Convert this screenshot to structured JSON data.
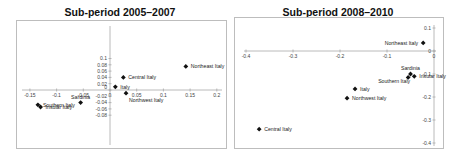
{
  "chart_data": [
    {
      "type": "scatter",
      "title": "Sub-period 2005–2007",
      "xlabel": "",
      "ylabel": "",
      "xlim": [
        -0.15,
        0.2
      ],
      "ylim": [
        -0.08,
        0.1
      ],
      "x_ticks": [
        -0.15,
        -0.1,
        -0.05,
        0,
        0.05,
        0.1,
        0.15,
        0.2
      ],
      "x_tick_labels": [
        "-0.15",
        "-0.1",
        "-0.05",
        "0",
        "0.05",
        "0.1",
        "0.15",
        "0.2"
      ],
      "y_ticks": [
        0.1,
        0.08,
        0.06,
        0.04,
        0.02,
        0,
        -0.02,
        -0.04,
        -0.06,
        -0.08
      ],
      "y_tick_labels": [
        "0.1",
        "0.08",
        "0.06",
        "0.04",
        "0.02",
        "0",
        "-0.02",
        "-0.04",
        "-0.06",
        "-0.08"
      ],
      "grid": false,
      "marker": "diamond",
      "points": [
        {
          "label": "Northeast Italy",
          "x": 0.142,
          "y": 0.075,
          "label_pos": "right"
        },
        {
          "label": "Central Italy",
          "x": 0.025,
          "y": 0.04,
          "label_pos": "right"
        },
        {
          "label": "Italy",
          "x": 0.01,
          "y": 0.01,
          "label_pos": "right"
        },
        {
          "label": "Northwest Italy",
          "x": 0.03,
          "y": -0.01,
          "label_pos": "below-right"
        },
        {
          "label": "Sardinia",
          "x": -0.055,
          "y": -0.04,
          "label_pos": "above"
        },
        {
          "label": "Southern Italy",
          "x": -0.135,
          "y": -0.047,
          "label_pos": "right"
        },
        {
          "label": "Insular Italy",
          "x": -0.13,
          "y": -0.054,
          "label_pos": "right"
        }
      ]
    },
    {
      "type": "scatter",
      "title": "Sub-period 2008–2010",
      "xlabel": "",
      "ylabel": "",
      "xlim": [
        -0.4,
        0
      ],
      "ylim": [
        -0.4,
        0.1
      ],
      "x_ticks": [
        -0.4,
        -0.3,
        -0.2,
        -0.1,
        0
      ],
      "x_tick_labels": [
        "-0.4",
        "-0.3",
        "-0.2",
        "-0.1",
        "0"
      ],
      "y_ticks": [
        0.1,
        0,
        -0.1,
        -0.2,
        -0.3,
        -0.4
      ],
      "y_tick_labels": [
        "0.1",
        "0",
        "-0.1",
        "-0.2",
        "-0.3",
        "-0.4"
      ],
      "grid": false,
      "marker": "diamond",
      "points": [
        {
          "label": "Northeast Italy",
          "x": -0.023,
          "y": 0.035,
          "label_pos": "left"
        },
        {
          "label": "Sardinia",
          "x": -0.05,
          "y": -0.1,
          "label_pos": "above"
        },
        {
          "label": "Insular Italy",
          "x": -0.042,
          "y": -0.11,
          "label_pos": "right"
        },
        {
          "label": "Southern Italy",
          "x": -0.055,
          "y": -0.115,
          "label_pos": "below-left"
        },
        {
          "label": "Italy",
          "x": -0.168,
          "y": -0.165,
          "label_pos": "right"
        },
        {
          "label": "Northwest Italy",
          "x": -0.185,
          "y": -0.205,
          "label_pos": "right"
        },
        {
          "label": "Central Italy",
          "x": -0.372,
          "y": -0.34,
          "label_pos": "right"
        }
      ]
    }
  ],
  "colors": {
    "marker": "#111111",
    "axis": "#a8a8a8",
    "frame": "#bdbdbd",
    "text": "#222222"
  }
}
